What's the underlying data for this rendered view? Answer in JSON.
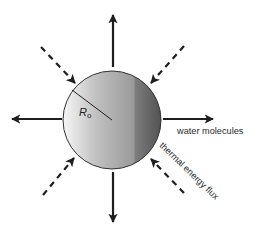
{
  "diagram": {
    "type": "evaporating sphere schematic",
    "sphere": {
      "center": [
        112,
        120
      ],
      "radius": 49,
      "gradient": [
        "#f4f4f4",
        "#bdbdbd",
        "#8e8e8e",
        "#5c5c5c"
      ],
      "stroke": "#333333"
    },
    "radius_line": {
      "from": [
        72,
        90
      ],
      "to": [
        112,
        120
      ]
    },
    "radius_label": {
      "main": "R",
      "sub": "o"
    },
    "outward_arrows": {
      "meaning": "water molecules",
      "style": "solid",
      "items": [
        {
          "dir": "up",
          "from": [
            113,
            67
          ],
          "to": [
            113,
            14
          ]
        },
        {
          "dir": "down",
          "from": [
            113,
            172
          ],
          "to": [
            113,
            223
          ]
        },
        {
          "dir": "left",
          "from": [
            62,
            119
          ],
          "to": [
            11,
            119
          ]
        },
        {
          "dir": "right",
          "from": [
            163,
            119
          ],
          "to": [
            214,
            119
          ]
        }
      ]
    },
    "inward_arrows": {
      "meaning": "thermal energy flux",
      "style": "dashed",
      "items": [
        {
          "dir": "from-top-left",
          "from": [
            41,
            47
          ],
          "to": [
            76,
            84
          ]
        },
        {
          "dir": "from-top-right",
          "from": [
            184,
            46
          ],
          "to": [
            150,
            84
          ]
        },
        {
          "dir": "from-bottom-left",
          "from": [
            43,
            195
          ],
          "to": [
            75,
            157
          ]
        },
        {
          "dir": "from-bottom-right",
          "from": [
            184,
            193
          ],
          "to": [
            150,
            158
          ]
        }
      ]
    },
    "labels": {
      "water_molecules": "water molecules",
      "thermal_energy_flux": "thermal energy flux"
    },
    "colors": {
      "arrow": "#1e1e1e",
      "text": "#2a2a2a",
      "background": "#ffffff"
    }
  }
}
